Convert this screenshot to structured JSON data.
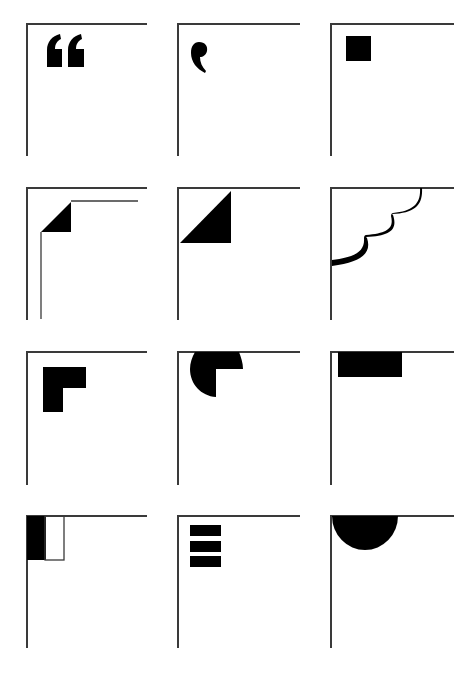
{
  "sheet": {
    "description": "Grid of 12 corner ornament glyphs",
    "rows": 4,
    "columns": 3,
    "line_color": "#3a3a3a",
    "fill_color": "#000000",
    "background": "#ffffff"
  },
  "tiles": [
    {
      "row": 1,
      "col": 1,
      "glyph": "double-quote-ornament"
    },
    {
      "row": 1,
      "col": 2,
      "glyph": "comma-ornament"
    },
    {
      "row": 1,
      "col": 3,
      "glyph": "square-ornament"
    },
    {
      "row": 2,
      "col": 1,
      "glyph": "folded-corner-double-line"
    },
    {
      "row": 2,
      "col": 2,
      "glyph": "triangle-corner"
    },
    {
      "row": 2,
      "col": 3,
      "glyph": "scalloped-corner"
    },
    {
      "row": 3,
      "col": 1,
      "glyph": "l-shape-ornament"
    },
    {
      "row": 3,
      "col": 2,
      "glyph": "three-quarter-disc-ornament"
    },
    {
      "row": 3,
      "col": 3,
      "glyph": "top-bar-ornament"
    },
    {
      "row": 4,
      "col": 1,
      "glyph": "half-filled-box-ornament"
    },
    {
      "row": 4,
      "col": 2,
      "glyph": "three-bars-ornament"
    },
    {
      "row": 4,
      "col": 3,
      "glyph": "half-disc-ornament"
    }
  ]
}
